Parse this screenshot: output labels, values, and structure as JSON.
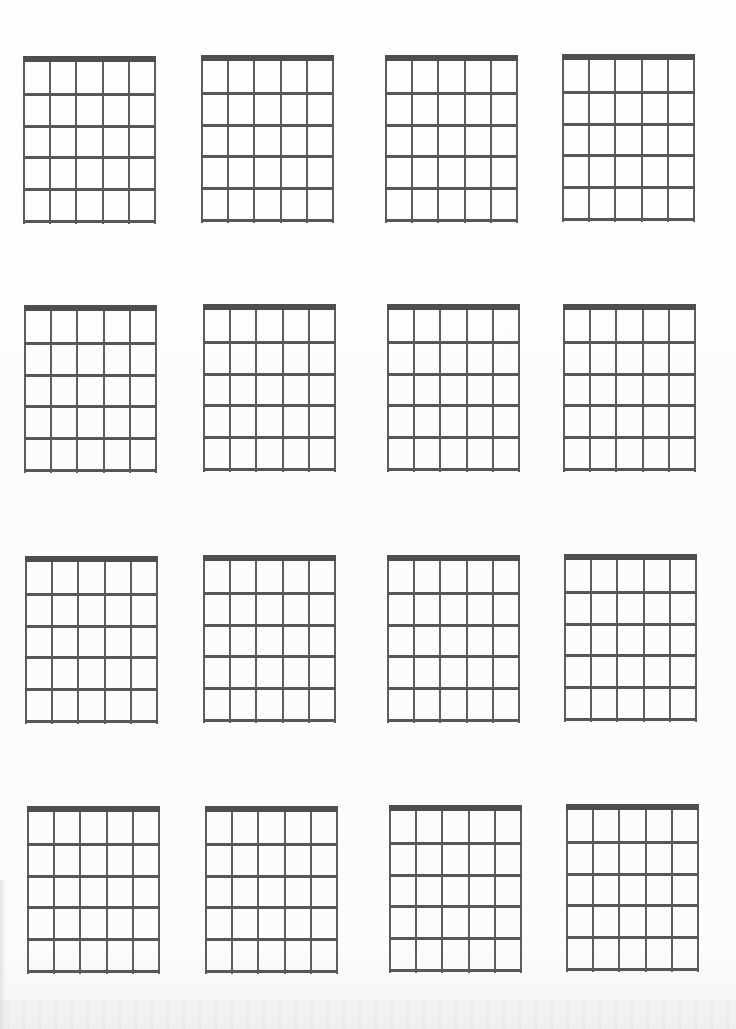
{
  "page": {
    "type": "blank guitar chord diagram sheet",
    "background_color": "#fcfcfc",
    "line_color": "#5a5a5a",
    "nut_color": "#4e4e4e"
  },
  "grid_spec": {
    "strings": 6,
    "frets": 5,
    "has_nut": true,
    "width": 133,
    "height": 168
  },
  "diagrams": [
    {
      "row": 1,
      "col": 1,
      "x": 23,
      "y": 56
    },
    {
      "row": 1,
      "col": 2,
      "x": 201,
      "y": 55
    },
    {
      "row": 1,
      "col": 3,
      "x": 385,
      "y": 55
    },
    {
      "row": 1,
      "col": 4,
      "x": 562,
      "y": 54
    },
    {
      "row": 2,
      "col": 1,
      "x": 24,
      "y": 305
    },
    {
      "row": 2,
      "col": 2,
      "x": 203,
      "y": 304
    },
    {
      "row": 2,
      "col": 3,
      "x": 387,
      "y": 304
    },
    {
      "row": 2,
      "col": 4,
      "x": 563,
      "y": 304
    },
    {
      "row": 3,
      "col": 1,
      "x": 25,
      "y": 556
    },
    {
      "row": 3,
      "col": 2,
      "x": 203,
      "y": 555
    },
    {
      "row": 3,
      "col": 3,
      "x": 387,
      "y": 555
    },
    {
      "row": 3,
      "col": 4,
      "x": 564,
      "y": 554
    },
    {
      "row": 4,
      "col": 1,
      "x": 27,
      "y": 806
    },
    {
      "row": 4,
      "col": 2,
      "x": 205,
      "y": 806
    },
    {
      "row": 4,
      "col": 3,
      "x": 389,
      "y": 805
    },
    {
      "row": 4,
      "col": 4,
      "x": 566,
      "y": 804
    }
  ]
}
